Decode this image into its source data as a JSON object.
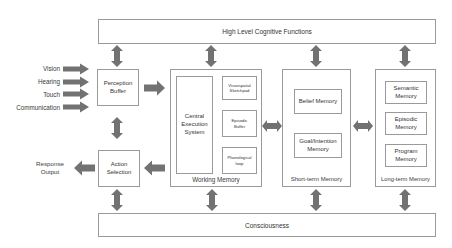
{
  "top_bar": {
    "label": "High Level Cognitive Functions"
  },
  "bottom_bar": {
    "label": "Consciousness"
  },
  "inputs": [
    "Vision",
    "Hearing",
    "Touch",
    "Communication"
  ],
  "perception_buffer": {
    "label": "Perception Buffer"
  },
  "action_selection": {
    "label": "Action Selection"
  },
  "response_output": {
    "label": "Response Output"
  },
  "working_memory": {
    "label": "Working Memory",
    "central": "Central Execution System",
    "components": [
      "Visuospatial Sketchpad",
      "Episodic Buffer",
      "Phonological loop"
    ]
  },
  "short_term_memory": {
    "label": "Short-term Memory",
    "components": [
      "Belief Memory",
      "Goal/Intention Memory"
    ]
  },
  "long_term_memory": {
    "label": "Long-term Memory",
    "components": [
      "Semantic Memory",
      "Episodic Memory",
      "Program Memory"
    ]
  },
  "colors": {
    "arrow": "#727272",
    "border": "#9a9a9a",
    "text": "#3a3a3a"
  }
}
